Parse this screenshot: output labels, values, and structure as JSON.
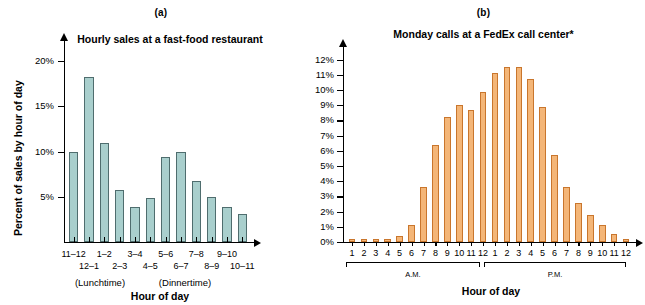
{
  "figure": {
    "panels": [
      {
        "letter": "(a)",
        "title": "Hourly sales at a fast-food restaurant",
        "xlabel": "Hour of day",
        "ylabel": "Percent of sales by hour of day",
        "notes": [
          "(Lunchtime)",
          "(Dinnertime)"
        ]
      },
      {
        "letter": "(b)",
        "title": "Monday calls at a FedEx call center*",
        "xlabel": "Hour of day",
        "groups": [
          "A.M.",
          "P.M."
        ]
      }
    ]
  },
  "chart_data": [
    {
      "type": "bar",
      "title": "Hourly sales at a fast-food restaurant",
      "panel": "(a)",
      "xlabel": "Hour of day",
      "ylabel": "Percent of sales by hour of day",
      "categories": [
        "11–12",
        "12–1",
        "1–2",
        "2–3",
        "3–4",
        "4–5",
        "5–6",
        "6–7",
        "7–8",
        "8–9",
        "9–10",
        "10–11"
      ],
      "values": [
        10.0,
        18.2,
        10.9,
        5.8,
        3.9,
        4.9,
        9.4,
        9.9,
        6.8,
        5.0,
        3.9,
        3.1
      ],
      "ylim": [
        0,
        21
      ],
      "yticks": [
        5,
        10,
        15,
        20
      ],
      "ytick_labels": [
        "5%",
        "10%",
        "15%",
        "20%"
      ],
      "annotations": [
        "(Lunchtime)",
        "(Dinnertime)"
      ],
      "grid": false,
      "legend": "none",
      "bar_color": "#a9cfcd",
      "bar_edge_color": "#4f6d6e"
    },
    {
      "type": "bar",
      "title": "Monday calls at a FedEx call center*",
      "panel": "(b)",
      "xlabel": "Hour of day",
      "ylabel": "",
      "categories": [
        "1",
        "2",
        "3",
        "4",
        "5",
        "6",
        "7",
        "8",
        "9",
        "10",
        "11",
        "12",
        "1",
        "2",
        "3",
        "4",
        "5",
        "6",
        "7",
        "8",
        "9",
        "10",
        "11",
        "12"
      ],
      "group_labels": [
        "A.M.",
        "P.M."
      ],
      "values": [
        0.2,
        0.2,
        0.2,
        0.2,
        0.4,
        1.1,
        3.6,
        6.4,
        8.2,
        9.0,
        8.7,
        9.9,
        11.1,
        11.5,
        11.5,
        10.7,
        8.9,
        5.7,
        3.6,
        2.6,
        1.8,
        1.1,
        0.5,
        0.2
      ],
      "ylim": [
        0,
        12.5
      ],
      "yticks": [
        0,
        1,
        2,
        3,
        4,
        5,
        6,
        7,
        8,
        9,
        10,
        11,
        12
      ],
      "ytick_labels": [
        "0%",
        "1%",
        "2%",
        "3%",
        "4%",
        "5%",
        "6%",
        "7%",
        "8%",
        "9%",
        "10%",
        "11%",
        "12%"
      ],
      "grid": false,
      "legend": "none",
      "bar_color": "#f4b678",
      "bar_edge_color": "#c9762d"
    }
  ]
}
